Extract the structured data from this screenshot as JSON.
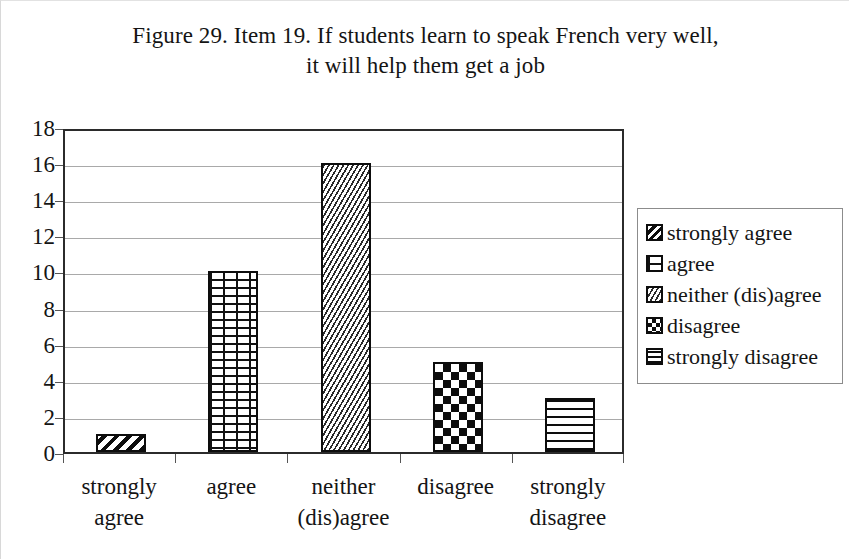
{
  "title": {
    "line1": "Figure 29. Item 19. If students learn to speak French very well,",
    "line2": "it will help them get a job"
  },
  "chart_data": {
    "type": "bar",
    "title": "Figure 29. Item 19. If students learn to speak French very well, it will help them get a job",
    "categories": [
      "strongly agree",
      "agree",
      "neither (dis)agree",
      "disagree",
      "strongly disagree"
    ],
    "category_lines": [
      [
        "strongly",
        "agree"
      ],
      [
        "agree"
      ],
      [
        "neither",
        "(dis)agree"
      ],
      [
        "disagree"
      ],
      [
        "strongly",
        "disagree"
      ]
    ],
    "values": [
      1,
      10,
      16,
      5,
      3
    ],
    "xlabel": "",
    "ylabel": "",
    "ylim": [
      0,
      18
    ],
    "ytick_step": 2,
    "yticks": [
      18,
      16,
      14,
      12,
      10,
      8,
      6,
      4,
      2,
      0
    ],
    "grid": true,
    "grid_axis": "y",
    "legend_position": "right",
    "series_patterns": [
      "diagonal-stripes",
      "brick",
      "zigzag",
      "checkerboard",
      "horizontal-lines"
    ],
    "colors": {
      "bar_outline": "#0d0d0d",
      "bar_fill": "#ffffff",
      "pattern": "#0d0d0d",
      "gridline": "#a9a9a9",
      "axis": "#2b2b2b",
      "text": "#141414",
      "background": "#ffffff"
    }
  },
  "legend": {
    "items": [
      {
        "label": "strongly agree",
        "pattern": "diagonal-stripes"
      },
      {
        "label": "agree",
        "pattern": "brick"
      },
      {
        "label": "neither (dis)agree",
        "pattern": "zigzag"
      },
      {
        "label": "disagree",
        "pattern": "checkerboard"
      },
      {
        "label": "strongly disagree",
        "pattern": "horizontal-lines"
      }
    ]
  }
}
